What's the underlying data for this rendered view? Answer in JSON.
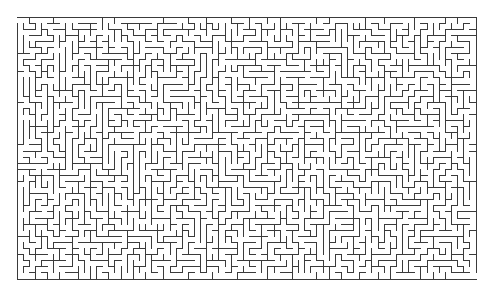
{
  "maze": {
    "type": "rectangular-perfect-maze",
    "columns": 75,
    "rows": 43,
    "origin": {
      "x": 17,
      "y": 17
    },
    "bounds": {
      "left": 17,
      "top": 17,
      "right": 476,
      "bottom": 279
    },
    "cell_width": 6.12,
    "cell_height": 6.093,
    "entrance": {
      "side": "left",
      "row": 0
    },
    "exit": {
      "side": "right",
      "row": 42
    },
    "seed": 493293
  },
  "colors": {
    "background": "#ffffff",
    "wall": "#3a3a3a"
  },
  "stroke_width": 1
}
